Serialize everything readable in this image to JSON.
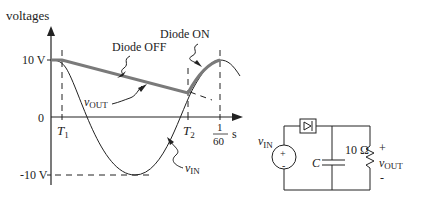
{
  "graph": {
    "y_axis_label": "voltages",
    "y_ticks": {
      "top": "10 V",
      "zero": "0",
      "bottom": "-10 V"
    },
    "x_ticks": {
      "t1": "T",
      "t1_sub": "1",
      "t2": "T",
      "t2_sub": "2",
      "period_num": "1",
      "period_den": "60",
      "unit": "s"
    },
    "annotations": {
      "diode_off": "Diode OFF",
      "diode_on": "Diode ON",
      "vout": "v",
      "vout_sub": "OUT",
      "vin": "v",
      "vin_sub": "IN"
    }
  },
  "circuit": {
    "source_label": "v",
    "source_sub": "IN",
    "source_plus": "+",
    "source_minus": "-",
    "capacitor_label": "C",
    "resistor_label": "10 Ω",
    "output_plus": "+",
    "output_label": "v",
    "output_sub": "OUT",
    "output_minus": "-"
  },
  "colors": {
    "line": "#222222",
    "thick": "#7a7a7a"
  }
}
